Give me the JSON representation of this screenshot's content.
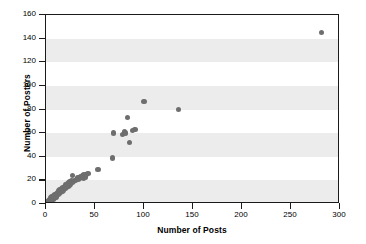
{
  "chart_data": {
    "type": "scatter",
    "title": "",
    "xlabel": "Number of Posts",
    "ylabel": "Number of Posters",
    "xlim": [
      0,
      300
    ],
    "ylim": [
      0,
      160
    ],
    "xticks": [
      0,
      50,
      100,
      150,
      200,
      250,
      300
    ],
    "yticks": [
      0,
      20,
      40,
      60,
      80,
      100,
      120,
      140,
      160
    ],
    "grid": false,
    "banded_background": true,
    "band_interval": 20,
    "legend": null,
    "marker_color": "#6e6e6e",
    "axis_color": "#1a1a1a",
    "band_color": "#ececec",
    "points": [
      [
        2,
        2
      ],
      [
        3,
        1
      ],
      [
        3,
        3
      ],
      [
        4,
        2
      ],
      [
        4,
        4
      ],
      [
        5,
        3
      ],
      [
        5,
        5
      ],
      [
        6,
        4
      ],
      [
        6,
        6
      ],
      [
        7,
        4
      ],
      [
        7,
        6
      ],
      [
        8,
        5
      ],
      [
        8,
        7
      ],
      [
        9,
        6
      ],
      [
        9,
        8
      ],
      [
        10,
        6
      ],
      [
        10,
        8
      ],
      [
        11,
        7
      ],
      [
        11,
        9
      ],
      [
        12,
        8
      ],
      [
        12,
        10
      ],
      [
        13,
        8
      ],
      [
        13,
        11
      ],
      [
        14,
        9
      ],
      [
        14,
        12
      ],
      [
        15,
        10
      ],
      [
        15,
        12
      ],
      [
        16,
        11
      ],
      [
        16,
        13
      ],
      [
        17,
        11
      ],
      [
        17,
        14
      ],
      [
        18,
        12
      ],
      [
        18,
        14
      ],
      [
        19,
        13
      ],
      [
        19,
        15
      ],
      [
        20,
        13
      ],
      [
        20,
        16
      ],
      [
        21,
        14
      ],
      [
        21,
        16
      ],
      [
        22,
        15
      ],
      [
        22,
        17
      ],
      [
        23,
        15
      ],
      [
        23,
        18
      ],
      [
        24,
        16
      ],
      [
        24,
        19
      ],
      [
        25,
        17
      ],
      [
        25,
        19
      ],
      [
        26,
        18
      ],
      [
        26,
        20
      ],
      [
        27,
        18
      ],
      [
        27,
        24
      ],
      [
        28,
        19
      ],
      [
        29,
        20
      ],
      [
        30,
        20
      ],
      [
        31,
        21
      ],
      [
        32,
        22
      ],
      [
        33,
        21
      ],
      [
        34,
        22
      ],
      [
        35,
        23
      ],
      [
        36,
        23
      ],
      [
        37,
        24
      ],
      [
        38,
        22
      ],
      [
        38,
        25
      ],
      [
        39,
        24
      ],
      [
        40,
        23
      ],
      [
        41,
        25
      ],
      [
        43,
        26
      ],
      [
        53,
        29
      ],
      [
        68,
        39
      ],
      [
        69,
        60
      ],
      [
        78,
        59
      ],
      [
        80,
        61
      ],
      [
        81,
        60
      ],
      [
        83,
        73
      ],
      [
        85,
        52
      ],
      [
        88,
        62
      ],
      [
        91,
        63
      ],
      [
        100,
        87
      ],
      [
        135,
        80
      ],
      [
        281,
        145
      ]
    ]
  }
}
